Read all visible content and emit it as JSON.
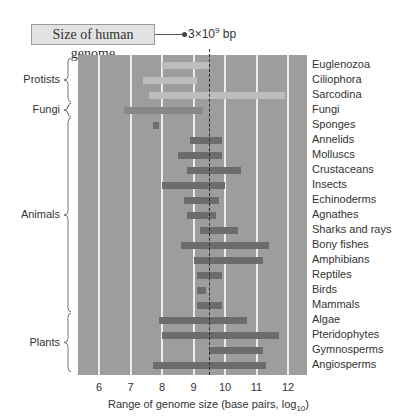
{
  "chart_data": {
    "type": "bar",
    "subtype": "range (floating horizontal bars)",
    "title": "",
    "annotation": {
      "callout_label": "Size of human genome",
      "value_text_prefix": "3×10",
      "value_text_exp": "9",
      "value_text_suffix": " bp",
      "x": 9.48
    },
    "xlabel_main": "Range of genome size (base pairs, log",
    "xlabel_sub": "10",
    "xlabel_end": ")",
    "xlim": [
      5.5,
      12.5
    ],
    "xticks": [
      "6",
      "7",
      "8",
      "9",
      "10",
      "11",
      "12"
    ],
    "grid": "vertical",
    "groups": [
      {
        "name": "Protists",
        "rows": [
          "Euglenozoa",
          "Ciliophora",
          "Sarcodina"
        ]
      },
      {
        "name": "Fungi",
        "rows": [
          "Fungi"
        ]
      },
      {
        "name": "Animals",
        "rows": [
          "Sponges",
          "Annelids",
          "Molluscs",
          "Crustaceans",
          "Insects",
          "Echinoderms",
          "Agnathes",
          "Sharks and rays",
          "Bony fishes",
          "Amphibians",
          "Reptiles",
          "Birds",
          "Mammals"
        ]
      },
      {
        "name": "Plants",
        "rows": [
          "Algae",
          "Pteridophytes",
          "Gymnosperms",
          "Angiosperms"
        ]
      }
    ],
    "series": [
      {
        "category": "Euglenozoa",
        "min": 8.0,
        "max": 9.5,
        "shade": "light"
      },
      {
        "category": "Ciliophora",
        "min": 7.4,
        "max": 9.1,
        "shade": "light"
      },
      {
        "category": "Sarcodina",
        "min": 7.6,
        "max": 11.9,
        "shade": "light"
      },
      {
        "category": "Fungi",
        "min": 6.8,
        "max": 9.3,
        "shade": "mid"
      },
      {
        "category": "Sponges",
        "min": 7.7,
        "max": 7.9,
        "shade": "dark"
      },
      {
        "category": "Annelids",
        "min": 8.9,
        "max": 9.9,
        "shade": "dark"
      },
      {
        "category": "Molluscs",
        "min": 8.5,
        "max": 9.9,
        "shade": "dark"
      },
      {
        "category": "Crustaceans",
        "min": 8.8,
        "max": 10.5,
        "shade": "dark"
      },
      {
        "category": "Insects",
        "min": 8.0,
        "max": 10.0,
        "shade": "dark"
      },
      {
        "category": "Echinoderms",
        "min": 8.7,
        "max": 9.8,
        "shade": "dark"
      },
      {
        "category": "Agnathes",
        "min": 8.8,
        "max": 9.7,
        "shade": "dark"
      },
      {
        "category": "Sharks and rays",
        "min": 9.2,
        "max": 10.4,
        "shade": "dark"
      },
      {
        "category": "Bony fishes",
        "min": 8.6,
        "max": 11.4,
        "shade": "dark"
      },
      {
        "category": "Amphibians",
        "min": 9.0,
        "max": 11.2,
        "shade": "dark"
      },
      {
        "category": "Reptiles",
        "min": 9.1,
        "max": 9.9,
        "shade": "dark"
      },
      {
        "category": "Birds",
        "min": 9.1,
        "max": 9.4,
        "shade": "dark"
      },
      {
        "category": "Mammals",
        "min": 9.1,
        "max": 9.9,
        "shade": "dark"
      },
      {
        "category": "Algae",
        "min": 7.9,
        "max": 10.7,
        "shade": "dark"
      },
      {
        "category": "Pteridophytes",
        "min": 8.0,
        "max": 11.7,
        "shade": "dark"
      },
      {
        "category": "Gymnosperms",
        "min": 9.5,
        "max": 11.2,
        "shade": "dark"
      },
      {
        "category": "Angiosperms",
        "min": 7.7,
        "max": 11.3,
        "shade": "dark"
      }
    ],
    "colors": {
      "plot_background": "#9d9d9d",
      "gridline": "#ececec",
      "bar_light": "#bdbdbd",
      "bar_mid": "#878787",
      "bar_dark": "#6c6c6c"
    }
  }
}
